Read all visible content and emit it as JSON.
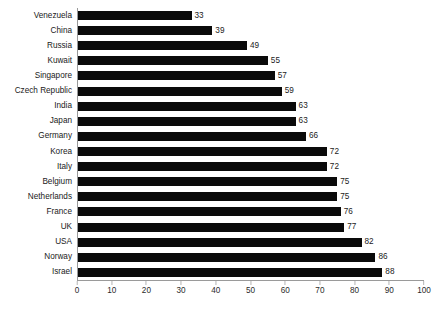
{
  "chart_data": {
    "type": "bar",
    "orientation": "horizontal",
    "title": "",
    "subtitle": "",
    "xlabel": "",
    "ylabel": "",
    "xlim": [
      0,
      100
    ],
    "xticks": [
      "0",
      "10",
      "20",
      "30",
      "40",
      "50",
      "60",
      "70",
      "80",
      "90",
      "100"
    ],
    "grid": false,
    "legend": false,
    "bar_color": "#0a0a0a",
    "axis_color": "#9a9a9a",
    "background": "#ffffff",
    "show_data_labels": true,
    "categories": [
      "Venezuela",
      "China",
      "Russia",
      "Kuwait",
      "Singapore",
      "Czech Republic",
      "India",
      "Japan",
      "Germany",
      "Korea",
      "Italy",
      "Belgium",
      "Netherlands",
      "France",
      "UK",
      "USA",
      "Norway",
      "Israel"
    ],
    "values": [
      33,
      39,
      49,
      55,
      57,
      59,
      63,
      63,
      66,
      72,
      72,
      75,
      75,
      76,
      77,
      82,
      86,
      88
    ],
    "rows": [
      {
        "label": "Venezuela",
        "value": 33,
        "value_text": "33"
      },
      {
        "label": "China",
        "value": 39,
        "value_text": "39"
      },
      {
        "label": "Russia",
        "value": 49,
        "value_text": "49"
      },
      {
        "label": "Kuwait",
        "value": 55,
        "value_text": "55"
      },
      {
        "label": "Singapore",
        "value": 57,
        "value_text": "57"
      },
      {
        "label": "Czech Republic",
        "value": 59,
        "value_text": "59"
      },
      {
        "label": "India",
        "value": 63,
        "value_text": "63"
      },
      {
        "label": "Japan",
        "value": 63,
        "value_text": "63"
      },
      {
        "label": "Germany",
        "value": 66,
        "value_text": "66"
      },
      {
        "label": "Korea",
        "value": 72,
        "value_text": "72"
      },
      {
        "label": "Italy",
        "value": 72,
        "value_text": "72"
      },
      {
        "label": "Belgium",
        "value": 75,
        "value_text": "75"
      },
      {
        "label": "Netherlands",
        "value": 75,
        "value_text": "75"
      },
      {
        "label": "France",
        "value": 76,
        "value_text": "76"
      },
      {
        "label": "UK",
        "value": 77,
        "value_text": "77"
      },
      {
        "label": "USA",
        "value": 82,
        "value_text": "82"
      },
      {
        "label": "Norway",
        "value": 86,
        "value_text": "86"
      },
      {
        "label": "Israel",
        "value": 88,
        "value_text": "88"
      }
    ]
  }
}
